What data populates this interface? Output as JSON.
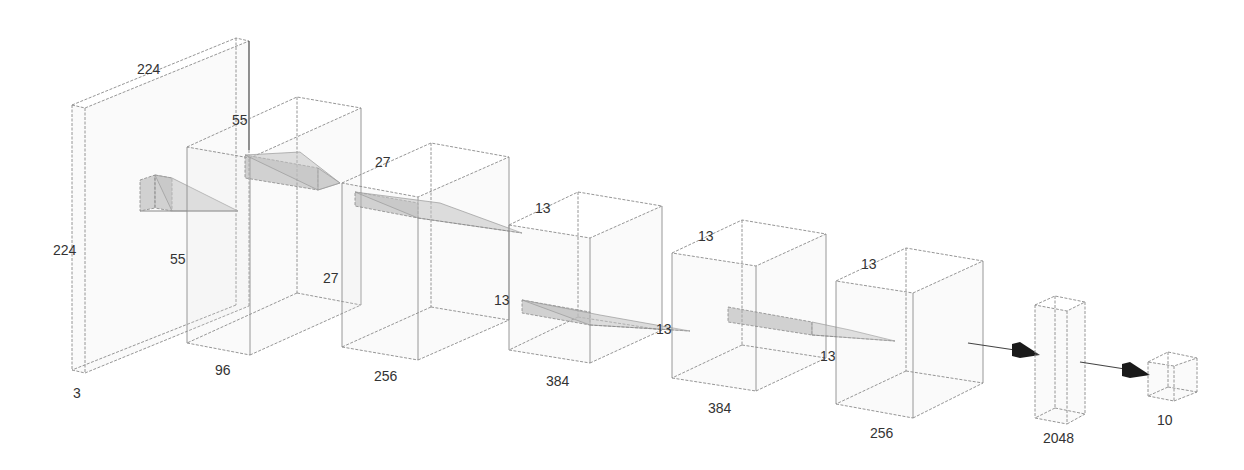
{
  "diagram": {
    "title": "",
    "type": "cnn-architecture",
    "layers": [
      {
        "name": "input",
        "width": "224",
        "height": "224",
        "depth": "3"
      },
      {
        "name": "conv1",
        "width": "55",
        "height": "55",
        "depth": "96"
      },
      {
        "name": "conv2",
        "width": "27",
        "height": "27",
        "depth": "256"
      },
      {
        "name": "conv3",
        "width": "13",
        "height": "13",
        "depth": "384"
      },
      {
        "name": "conv4",
        "width": "13",
        "height": "13",
        "depth": "384"
      },
      {
        "name": "conv5",
        "width": "13",
        "height": "13",
        "depth": "256"
      },
      {
        "name": "fc",
        "depth": "2048"
      },
      {
        "name": "output",
        "depth": "10"
      }
    ],
    "labels": {
      "input_top": "224",
      "input_side": "224",
      "input_depth": "3",
      "conv1_top": "55",
      "conv1_side": "55",
      "conv1_depth": "96",
      "conv2_top": "27",
      "conv2_side": "27",
      "conv2_depth": "256",
      "conv3_top": "13",
      "conv3_side": "13",
      "conv3_depth": "384",
      "conv4_top": "13",
      "conv4_side": "13",
      "conv4_depth": "384",
      "conv5_top": "13",
      "conv5_side": "13",
      "conv5_depth": "256",
      "fc_depth": "2048",
      "output_depth": "10"
    },
    "colors": {
      "edge": "#8a8a8a",
      "kernel": "#afafaf",
      "arrow": "#1a1a1a",
      "text": "#333333"
    }
  }
}
